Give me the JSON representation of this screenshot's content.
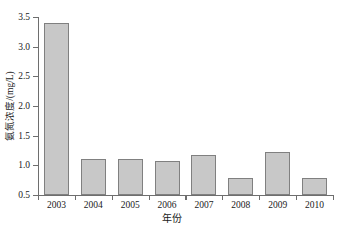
{
  "chart_data": {
    "type": "bar",
    "title": "",
    "xlabel": "年份",
    "ylabel": "氨氮浓度/(mg/L)",
    "categories": [
      "2003",
      "2004",
      "2005",
      "2006",
      "2007",
      "2008",
      "2009",
      "2010"
    ],
    "values": [
      3.4,
      1.11,
      1.11,
      1.07,
      1.17,
      0.79,
      1.23,
      0.79
    ],
    "ylim": [
      0.5,
      3.5
    ],
    "ytick_labels": [
      "0.5",
      "1.0",
      "1.5",
      "2.0",
      "2.5",
      "3.0",
      "3.5"
    ],
    "ytick_values": [
      0.5,
      1.0,
      1.5,
      2.0,
      2.5,
      3.0,
      3.5
    ],
    "grid": false,
    "legend": null,
    "bar_fill_color": "#c8c8c8",
    "bar_edge_color": "#808080",
    "axis_color": "#6e6e6e"
  }
}
